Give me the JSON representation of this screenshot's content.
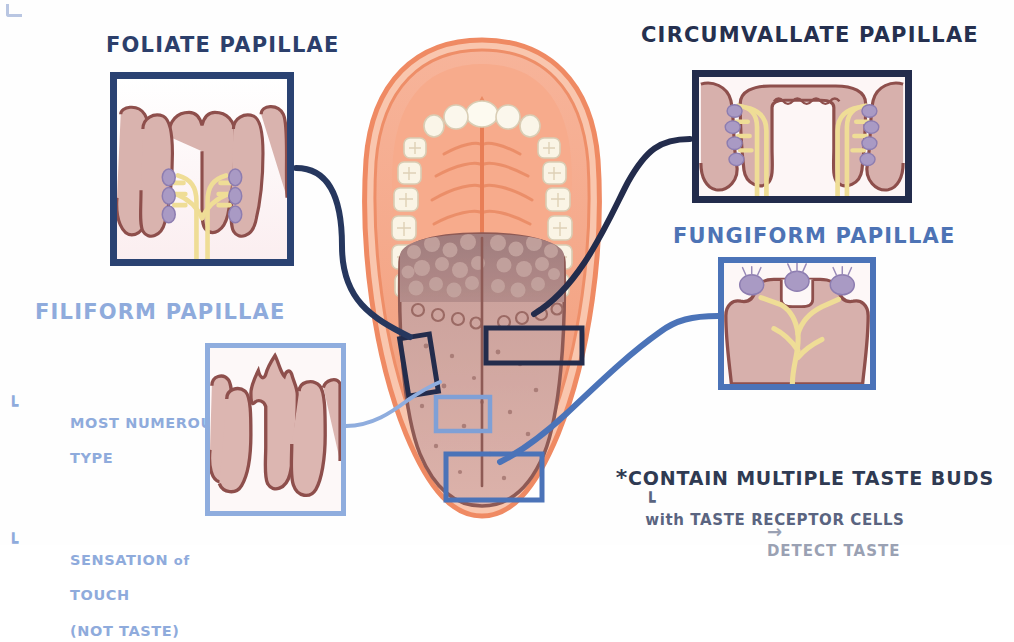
{
  "diagram": {
    "background_color": "#fefefe"
  },
  "labels": {
    "foliate": "FOLIATE PAPILLAE",
    "circumvallate": "CIRCUMVALLATE PAPILLAE",
    "fungiform": "FUNGIFORM PAPILLAE",
    "filiform": "FILIFORM PAPILLAE"
  },
  "notes": {
    "filiform": {
      "bullet1_line1": "MOST NUMEROUS",
      "bullet1_line2": "TYPE",
      "bullet2_line1_a": "SENSATION ",
      "bullet2_line1_b": "of",
      "bullet2_line2": "TOUCH",
      "bullet2_line3": "(NOT TASTE)"
    },
    "taste_buds": {
      "asterisk": "*",
      "main_prefix": "CONTAIN MULTIPLE ",
      "main_bold": "TASTE BUDS",
      "sub_prefix": "with",
      "sub_rest": " TASTE RECEPTOR CELLS",
      "arrow": "→",
      "detect": "DETECT TASTE"
    }
  },
  "colors": {
    "navy_dark": "#232c4c",
    "navy": "#2a4272",
    "blue_medium": "#4b73b8",
    "blue_light": "#8fadde",
    "label_foliate": "#2c3f6b",
    "label_fungiform": "#4d73b5",
    "label_filiform": "#8fabdc",
    "tissue_outline": "#8f4c4c",
    "tissue_fill": "#d8b0ac",
    "tissue_fill_light": "#eccfcb",
    "nerve_yellow": "#f2e3a0",
    "taste_bud_purple": "#a99ac4",
    "mouth_orange": "#f08a64",
    "mouth_fill": "#f6a98c",
    "tooth_white": "#fbf6ea",
    "tongue_front": "#d9aba4",
    "tongue_back": "#9e7b7b",
    "detect_gray": "#9aa1b3"
  },
  "callout_boxes": [
    {
      "name": "foliate-region-box",
      "color": "#232c4c"
    },
    {
      "name": "circumvallate-region-box",
      "color": "#232c4c"
    },
    {
      "name": "filiform-region-box",
      "color": "#8fadde"
    },
    {
      "name": "fungiform-region-box",
      "color": "#4b73b8"
    }
  ],
  "insets": [
    {
      "name": "foliate-inset",
      "border": "#2a4272",
      "has_taste_buds": true,
      "shape": "parallel-folds"
    },
    {
      "name": "circumvallate-inset",
      "border": "#232c4c",
      "has_taste_buds": true,
      "shape": "wide-trenched-papilla"
    },
    {
      "name": "fungiform-inset",
      "border": "#4b73b8",
      "has_taste_buds": true,
      "shape": "mushroom"
    },
    {
      "name": "filiform-inset",
      "border": "#8fadde",
      "has_taste_buds": false,
      "shape": "spiky-flame"
    }
  ]
}
